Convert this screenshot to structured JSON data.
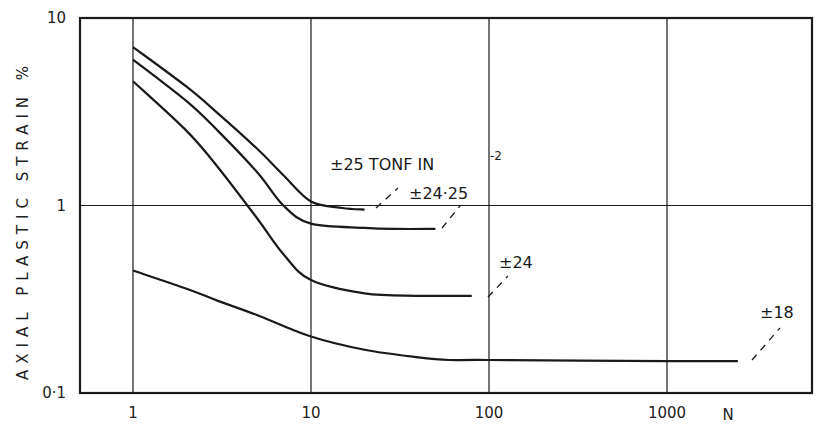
{
  "chart_data": {
    "type": "line",
    "title": "",
    "xlabel": "N",
    "ylabel": "AXIAL PLASTIC STRAIN %",
    "xscale": "log",
    "yscale": "log",
    "xlim": [
      0.5,
      5000
    ],
    "ylim": [
      0.1,
      10
    ],
    "x_ticks": [
      "1",
      "10",
      "100",
      "1000"
    ],
    "y_ticks": [
      "0·1",
      "1",
      "10"
    ],
    "grid": true,
    "legend": "inline annotations",
    "units_annotation": "TONF IN-2",
    "series": [
      {
        "name": "±25 TONF IN-2",
        "label": "±25",
        "x": [
          1,
          2,
          3,
          5,
          7,
          10,
          15,
          20
        ],
        "y": [
          7.0,
          4.3,
          3.1,
          2.0,
          1.45,
          1.05,
          0.97,
          0.95
        ]
      },
      {
        "name": "±24·25",
        "label": "±24·25",
        "x": [
          1,
          2,
          3,
          5,
          7,
          10,
          20,
          30,
          50
        ],
        "y": [
          6.0,
          3.6,
          2.5,
          1.5,
          1.0,
          0.8,
          0.76,
          0.75,
          0.75
        ]
      },
      {
        "name": "±24",
        "label": "±24",
        "x": [
          1,
          2,
          3,
          5,
          7,
          10,
          20,
          40,
          80
        ],
        "y": [
          4.6,
          2.5,
          1.6,
          0.85,
          0.55,
          0.4,
          0.34,
          0.33,
          0.33
        ]
      },
      {
        "name": "±18",
        "label": "±18",
        "x": [
          1,
          2,
          3,
          5,
          10,
          20,
          40,
          60,
          100,
          1000,
          2500
        ],
        "y": [
          0.45,
          0.36,
          0.31,
          0.26,
          0.2,
          0.17,
          0.155,
          0.15,
          0.15,
          0.148,
          0.148
        ]
      }
    ]
  },
  "labels": {
    "ylabel": "AXIAL  PLASTIC  STRAIN  %",
    "xlabel": "N",
    "series_25": "±25 TONF IN",
    "series_25_exp": "-2",
    "series_2425": "±24·25",
    "series_24": "±24",
    "series_18": "±18"
  }
}
